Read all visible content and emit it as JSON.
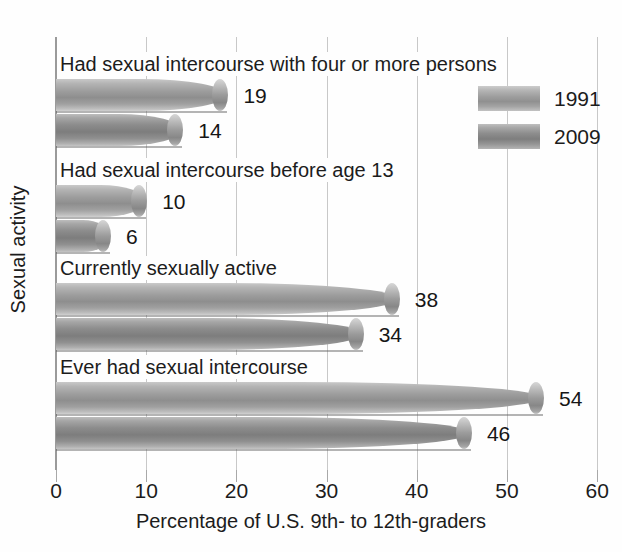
{
  "chart_data": {
    "type": "bar",
    "orientation": "horizontal",
    "title": "",
    "xlabel": "Percentage of U.S. 9th- to 12th-graders",
    "ylabel": "Sexual activity",
    "xlim": [
      0,
      60
    ],
    "xticks": [
      0,
      10,
      20,
      30,
      40,
      50,
      60
    ],
    "xtick_labels": [
      "0",
      "10",
      "20",
      "30",
      "40",
      "50",
      "60"
    ],
    "grid": true,
    "legend_position": "top-right",
    "categories": [
      "Had sexual intercourse with four or more persons",
      "Had sexual intercourse before age 13",
      "Currently sexually active",
      "Ever had sexual intercourse"
    ],
    "series": [
      {
        "name": "1991",
        "color": "#9d9d9d",
        "values": [
          19,
          10,
          38,
          54
        ]
      },
      {
        "name": "2009",
        "color": "#8c8c8c",
        "values": [
          14,
          6,
          34,
          46
        ]
      }
    ],
    "value_labels": [
      [
        "19",
        "14"
      ],
      [
        "10",
        "6"
      ],
      [
        "38",
        "34"
      ],
      [
        "54",
        "46"
      ]
    ]
  },
  "axis": {
    "x_title": "Percentage of U.S. 9th- to 12th-graders",
    "y_title": "Sexual activity",
    "ticks": [
      {
        "label": "0",
        "value": 0
      },
      {
        "label": "10",
        "value": 10
      },
      {
        "label": "20",
        "value": 20
      },
      {
        "label": "30",
        "value": 30
      },
      {
        "label": "40",
        "value": 40
      },
      {
        "label": "50",
        "value": 50
      },
      {
        "label": "60",
        "value": 60
      }
    ]
  },
  "legend": {
    "entries": [
      {
        "label": "1991",
        "series": "1991"
      },
      {
        "label": "2009",
        "series": "2009"
      }
    ]
  },
  "groups": [
    {
      "label": "Had sexual intercourse with four or more persons",
      "bars": [
        {
          "series": "1991",
          "value": 19,
          "value_label": "19"
        },
        {
          "series": "2009",
          "value": 14,
          "value_label": "14"
        }
      ]
    },
    {
      "label": "Had sexual intercourse before age 13",
      "bars": [
        {
          "series": "1991",
          "value": 10,
          "value_label": "10"
        },
        {
          "series": "2009",
          "value": 6,
          "value_label": "6"
        }
      ]
    },
    {
      "label": "Currently sexually active",
      "bars": [
        {
          "series": "1991",
          "value": 38,
          "value_label": "38"
        },
        {
          "series": "2009",
          "value": 34,
          "value_label": "34"
        }
      ]
    },
    {
      "label": "Ever had sexual intercourse",
      "bars": [
        {
          "series": "1991",
          "value": 54,
          "value_label": "54"
        },
        {
          "series": "2009",
          "value": 46,
          "value_label": "46"
        }
      ]
    }
  ]
}
